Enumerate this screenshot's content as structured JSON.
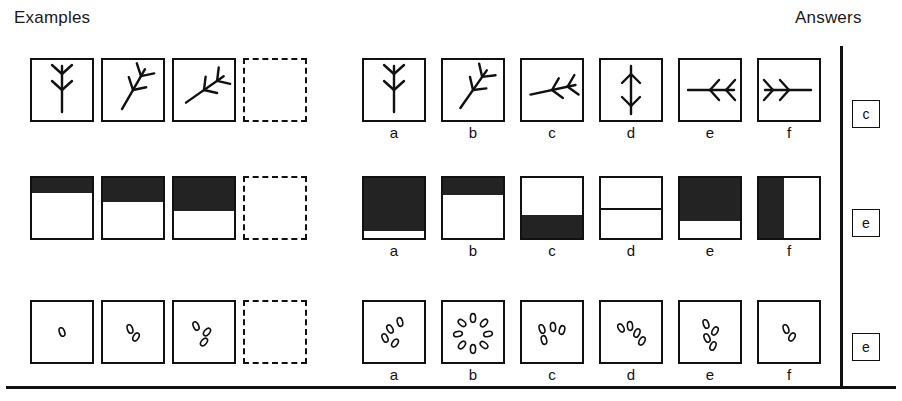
{
  "header": {
    "examples_label": "Examples",
    "answers_label": "Answers"
  },
  "option_letters": [
    "a",
    "b",
    "c",
    "d",
    "e",
    "f"
  ],
  "layout": {
    "example_x": [
      30,
      101,
      172,
      243
    ],
    "option_x": [
      362,
      441,
      520,
      599,
      678,
      757
    ],
    "box_w": 64,
    "box_h": 64,
    "row_y": [
      58,
      176,
      300
    ],
    "label_y": [
      124,
      242,
      366
    ],
    "divider_x": 840,
    "bottom_rule_y": 386,
    "answer_key_x": 852,
    "answer_key_y": [
      100,
      209,
      333
    ]
  },
  "style": {
    "ink": "#111111",
    "shade": "#232323",
    "paper": "#ffffff"
  },
  "rows": [
    {
      "id": "row-branch",
      "kind": "branching-figure",
      "rule": "branch figure rotates progressively counter-clockwise",
      "answer": "c",
      "examples": [
        {
          "name": "branch-up-vertical",
          "rotation_deg": 0,
          "blank": false
        },
        {
          "name": "branch-tilted-left",
          "rotation_deg": 30,
          "blank": false
        },
        {
          "name": "branch-tilted-more",
          "rotation_deg": 55,
          "blank": false
        },
        {
          "name": "blank-answer-slot",
          "rotation_deg": null,
          "blank": true
        }
      ],
      "options": [
        {
          "letter": "a",
          "name": "branch-up-vertical",
          "rotation_deg": 0
        },
        {
          "letter": "b",
          "name": "branch-tilted-30",
          "rotation_deg": 35
        },
        {
          "letter": "c",
          "name": "branch-tilted-75",
          "rotation_deg": 78
        },
        {
          "letter": "d",
          "name": "branch-double-arrow-up",
          "rotation_deg": 180
        },
        {
          "letter": "e",
          "name": "branch-horizontal-left",
          "rotation_deg": 90
        },
        {
          "letter": "f",
          "name": "branch-horizontal-right",
          "rotation_deg": -90
        }
      ]
    },
    {
      "id": "row-shading",
      "kind": "partial-fill",
      "rule": "black shaded area grows from the top of the square",
      "answer": "e",
      "examples": [
        {
          "name": "square-filled-top-25",
          "fill_pct": 25,
          "fill_from": "top",
          "blank": false
        },
        {
          "name": "square-filled-top-40",
          "fill_pct": 40,
          "fill_from": "top",
          "blank": false
        },
        {
          "name": "square-filled-top-55",
          "fill_pct": 55,
          "fill_from": "top",
          "blank": false
        },
        {
          "name": "blank-answer-slot",
          "fill_pct": null,
          "fill_from": null,
          "blank": true
        }
      ],
      "options": [
        {
          "letter": "a",
          "name": "square-filled-top-88",
          "fill_pct": 88,
          "fill_from": "top"
        },
        {
          "letter": "b",
          "name": "square-filled-top-28",
          "fill_pct": 28,
          "fill_from": "top"
        },
        {
          "letter": "c",
          "name": "square-filled-bottom-38",
          "fill_pct": 38,
          "fill_from": "bottom"
        },
        {
          "letter": "d",
          "name": "square-split-line-half",
          "fill_pct": 0,
          "fill_from": "line-50"
        },
        {
          "letter": "e",
          "name": "square-filled-top-72",
          "fill_pct": 72,
          "fill_from": "top"
        },
        {
          "letter": "f",
          "name": "square-filled-left-42",
          "fill_pct": 42,
          "fill_from": "left"
        }
      ]
    },
    {
      "id": "row-ovals",
      "kind": "count-of-ovals",
      "rule": "one more small oval is added in each successive square",
      "answer": "e",
      "examples": [
        {
          "name": "ovals-count-1",
          "count": 1,
          "blank": false
        },
        {
          "name": "ovals-count-2",
          "count": 2,
          "blank": false
        },
        {
          "name": "ovals-count-3",
          "count": 3,
          "blank": false
        },
        {
          "name": "blank-answer-slot",
          "count": null,
          "blank": true
        }
      ],
      "options": [
        {
          "letter": "a",
          "name": "ovals-count-4-diagonal",
          "count": 4
        },
        {
          "letter": "b",
          "name": "ovals-count-8-ring",
          "count": 8
        },
        {
          "letter": "c",
          "name": "ovals-count-4-arc",
          "count": 4
        },
        {
          "letter": "d",
          "name": "ovals-count-4-fan",
          "count": 4
        },
        {
          "letter": "e",
          "name": "ovals-count-4-cluster",
          "count": 4
        },
        {
          "letter": "f",
          "name": "ovals-count-2",
          "count": 2
        }
      ]
    }
  ],
  "answer_key": [
    "c",
    "e",
    "e"
  ]
}
